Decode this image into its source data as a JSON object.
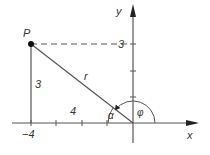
{
  "diagram": {
    "type": "polar-coordinates",
    "point": {
      "label": "P",
      "x": -4,
      "y": 3
    },
    "labels": {
      "x_axis": "x",
      "y_axis": "y",
      "x_tick": "−4",
      "y_tick": "3",
      "vertical_leg": "3",
      "horizontal_leg": "4",
      "radius": "r",
      "alpha": "α",
      "phi": "φ"
    },
    "colors": {
      "line": "#555555",
      "axis": "#444444",
      "point": "#111111",
      "text": "#333333"
    }
  }
}
